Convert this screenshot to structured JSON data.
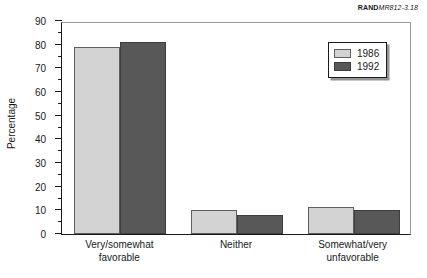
{
  "source_tag": {
    "brand": "RAND",
    "code": "MR812-3.18"
  },
  "legend": {
    "position": "upper-right",
    "entries": [
      {
        "label": "1986",
        "color": "#d3d3d3"
      },
      {
        "label": "1992",
        "color": "#585858"
      }
    ]
  },
  "axis": {
    "ylabel": "Percentage",
    "yticks": [
      "0",
      "10",
      "20",
      "30",
      "40",
      "50",
      "60",
      "70",
      "80",
      "90"
    ]
  },
  "categories": {
    "c0_line1": "Very/somewhat",
    "c0_line2": "favorable",
    "c1_line1": "Neither",
    "c1_line2": "",
    "c2_line1": "Somewhat/very",
    "c2_line2": "unfavorable"
  },
  "chart_data": {
    "type": "bar",
    "title": "",
    "xlabel": "",
    "ylabel": "Percentage",
    "ylim": [
      0,
      90
    ],
    "ytick_step": 10,
    "yminor_step": 5,
    "grid": false,
    "legend_position": "upper right",
    "categories": [
      "Very/somewhat favorable",
      "Neither",
      "Somewhat/very unfavorable"
    ],
    "series": [
      {
        "name": "1986",
        "color": "#d3d3d3",
        "values": [
          79,
          10,
          11.5
        ]
      },
      {
        "name": "1992",
        "color": "#585858",
        "values": [
          81,
          8,
          10
        ]
      }
    ]
  }
}
